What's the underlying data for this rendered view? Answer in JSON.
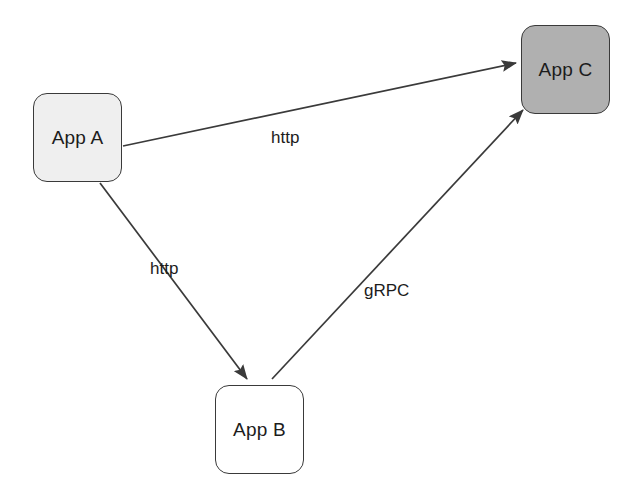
{
  "diagram": {
    "type": "service-dependency-graph",
    "background_color": "#ffffff",
    "edge_color": "#3a3a3a",
    "nodes": [
      {
        "id": "app-a",
        "label": "App A",
        "x": 33,
        "y": 93,
        "width": 89,
        "height": 89,
        "fill": "#efefef",
        "stroke": "#3a3a3a"
      },
      {
        "id": "app-b",
        "label": "App B",
        "x": 215,
        "y": 385,
        "width": 89,
        "height": 89,
        "fill": "#ffffff",
        "stroke": "#3a3a3a"
      },
      {
        "id": "app-c",
        "label": "App C",
        "x": 521,
        "y": 25,
        "width": 89,
        "height": 89,
        "fill": "#b0b0b0",
        "stroke": "#3a3a3a"
      }
    ],
    "edges": [
      {
        "id": "edge-a-to-c",
        "from": "app-a",
        "to": "app-c",
        "label": "http",
        "label_x": 271,
        "label_y": 129,
        "x1": 123,
        "y1": 146,
        "x2": 516,
        "y2": 63
      },
      {
        "id": "edge-a-to-b",
        "from": "app-a",
        "to": "app-b",
        "label": "http",
        "label_x": 150,
        "label_y": 260,
        "x1": 100,
        "y1": 183,
        "x2": 247,
        "y2": 379
      },
      {
        "id": "edge-b-to-c",
        "from": "app-b",
        "to": "app-c",
        "label": "gRPC",
        "label_x": 364,
        "label_y": 282,
        "x1": 272,
        "y1": 379,
        "x2": 523,
        "y2": 110
      }
    ]
  }
}
